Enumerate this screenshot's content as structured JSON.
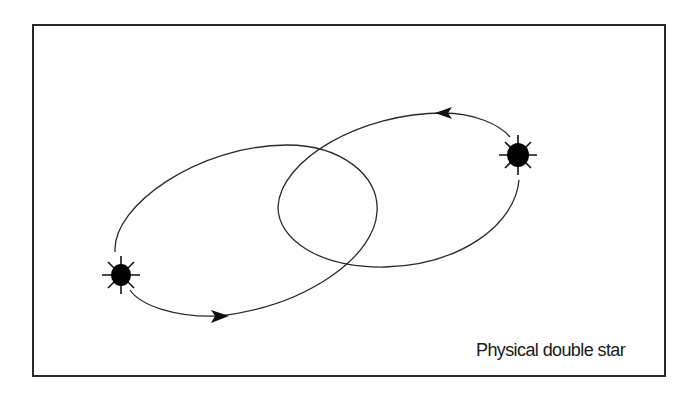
{
  "figure": {
    "caption": "Physical double star",
    "colors": {
      "line": "#2a2a2a",
      "star": "#000000",
      "background": "#ffffff"
    },
    "stars": [
      {
        "name": "star-a",
        "icon": "star-icon"
      },
      {
        "name": "star-b",
        "icon": "star-icon"
      }
    ],
    "orbits": [
      {
        "name": "orbit-a",
        "direction": "clockwise-arrow"
      },
      {
        "name": "orbit-b",
        "direction": "counterclockwise-arrow"
      }
    ]
  }
}
